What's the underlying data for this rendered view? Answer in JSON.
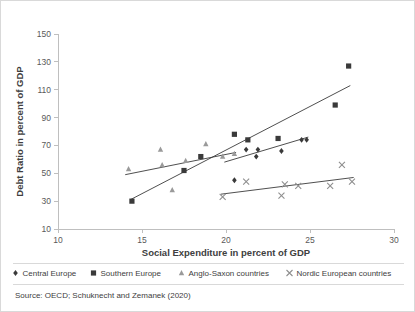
{
  "chart_data": {
    "type": "scatter",
    "title": "",
    "xlabel": "Social Expenditure in percent of GDP",
    "ylabel": "Debt Ratio in percent of GDP",
    "xlim": [
      10,
      30
    ],
    "ylim": [
      10,
      150
    ],
    "xticks": [
      10,
      15,
      20,
      25,
      30
    ],
    "yticks": [
      10,
      30,
      50,
      70,
      90,
      110,
      130,
      150
    ],
    "grid": false,
    "legend_position": "bottom",
    "source": "Source: OECD; Schuknecht and Zemanek (2020)",
    "series": [
      {
        "name": "Central Europe",
        "marker": "diamond",
        "color": "#3a3a3a",
        "points": [
          {
            "x": 20.5,
            "y": 45
          },
          {
            "x": 21.2,
            "y": 67
          },
          {
            "x": 21.8,
            "y": 62
          },
          {
            "x": 21.9,
            "y": 67
          },
          {
            "x": 23.3,
            "y": 66
          },
          {
            "x": 24.5,
            "y": 74
          },
          {
            "x": 24.8,
            "y": 74
          }
        ],
        "trendline": {
          "x1": 19.9,
          "y1": 58,
          "x2": 24.9,
          "y2": 76
        }
      },
      {
        "name": "Southern Europe",
        "marker": "square",
        "color": "#3a3a3a",
        "points": [
          {
            "x": 14.4,
            "y": 30
          },
          {
            "x": 17.5,
            "y": 52
          },
          {
            "x": 18.5,
            "y": 62
          },
          {
            "x": 20.5,
            "y": 78
          },
          {
            "x": 21.3,
            "y": 74
          },
          {
            "x": 23.1,
            "y": 75
          },
          {
            "x": 26.5,
            "y": 99
          },
          {
            "x": 27.3,
            "y": 127
          }
        ],
        "trendline": {
          "x1": 14.3,
          "y1": 31,
          "x2": 27.4,
          "y2": 113
        }
      },
      {
        "name": "Anglo-Saxon countries",
        "marker": "triangle",
        "color": "#9a9a9a",
        "points": [
          {
            "x": 14.2,
            "y": 53
          },
          {
            "x": 16.1,
            "y": 67
          },
          {
            "x": 16.2,
            "y": 56
          },
          {
            "x": 16.8,
            "y": 38
          },
          {
            "x": 17.6,
            "y": 59
          },
          {
            "x": 18.8,
            "y": 71
          },
          {
            "x": 19.8,
            "y": 62
          },
          {
            "x": 20.5,
            "y": 64
          }
        ],
        "trendline": {
          "x1": 14.0,
          "y1": 49,
          "x2": 20.6,
          "y2": 65
        }
      },
      {
        "name": "Nordic European countries",
        "marker": "cross",
        "color": "#8f8f8f",
        "points": [
          {
            "x": 19.8,
            "y": 33
          },
          {
            "x": 21.2,
            "y": 44
          },
          {
            "x": 23.3,
            "y": 34
          },
          {
            "x": 23.5,
            "y": 42
          },
          {
            "x": 24.3,
            "y": 41
          },
          {
            "x": 26.2,
            "y": 41
          },
          {
            "x": 26.9,
            "y": 56
          },
          {
            "x": 27.5,
            "y": 44
          }
        ],
        "trendline": {
          "x1": 19.7,
          "y1": 35,
          "x2": 27.6,
          "y2": 47
        }
      }
    ]
  },
  "axes": {
    "x_title": "Social Expenditure in percent of GDP",
    "y_title": "Debt Ratio in percent of GDP",
    "x_tick_labels": [
      "10",
      "15",
      "20",
      "25",
      "30"
    ],
    "y_tick_labels": [
      "10",
      "30",
      "50",
      "70",
      "90",
      "110",
      "130",
      "150"
    ]
  },
  "legend": {
    "items": [
      {
        "label": "Central Europe",
        "marker": "diamond"
      },
      {
        "label": "Southern Europe",
        "marker": "square"
      },
      {
        "label": "Anglo-Saxon countries",
        "marker": "triangle"
      },
      {
        "label": "Nordic European countries",
        "marker": "cross"
      }
    ]
  },
  "footer": {
    "source": "Source: OECD; Schuknecht and Zemanek (2020)"
  },
  "colors": {
    "dark_marker": "#3a3a3a",
    "light_marker": "#9a9a9a",
    "axis": "#bfbfbf",
    "text": "#404040",
    "border": "#d9d9d9"
  }
}
